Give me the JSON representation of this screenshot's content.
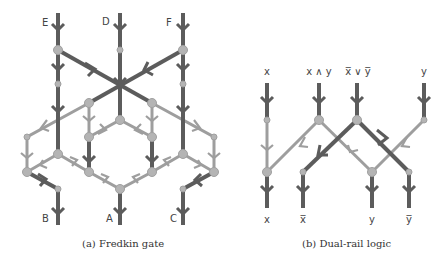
{
  "colors": {
    "dark_wire": "#5c5c5c",
    "light_wire": "#9e9e9e",
    "node": "#b4b4b4"
  },
  "panel_a": {
    "caption": "(a) Fredkin gate",
    "inputs": [
      "E",
      "D",
      "F"
    ],
    "outputs": [
      "B",
      "A",
      "C"
    ]
  },
  "panel_b": {
    "caption": "(b) Dual-rail logic",
    "inputs": [
      "x",
      "x ∧ y",
      "x̅ ∨ y̅",
      "y"
    ],
    "outputs": [
      "x",
      "x̅",
      "y",
      "y̅"
    ]
  }
}
